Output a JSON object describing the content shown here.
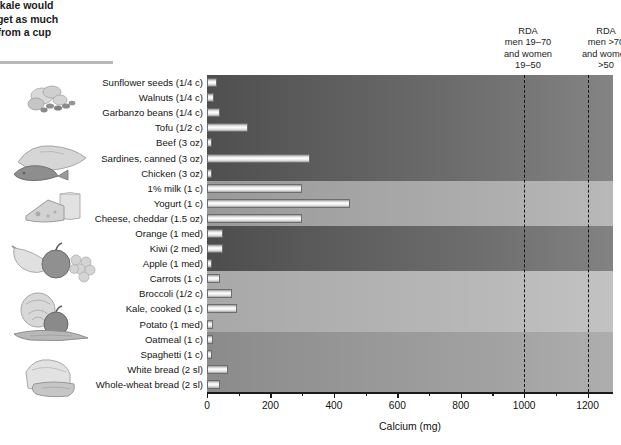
{
  "caption": {
    "lines": [
      "ooked kale would",
      "eat to get as much",
      "ou do from a cup"
    ]
  },
  "rda_labels": [
    {
      "line1": "RDA",
      "line2": "men 19–70",
      "line3": "and women",
      "line4": "19–50",
      "value": 1000
    },
    {
      "line1": "RDA",
      "line2": "men >70",
      "line3": "and women",
      "line4": ">50",
      "value": 1200
    }
  ],
  "axis": {
    "title": "Calcium (mg)",
    "ticks": [
      0,
      200,
      400,
      600,
      800,
      1000,
      1200
    ],
    "min": 0,
    "max": 1280
  },
  "colors": {
    "band_protein": "#4f4f4f",
    "band_dairy": "#9a9a9a",
    "band_fruit": "#4d4d4d",
    "band_vegetable": "#a8a8a8",
    "band_grain": "#8b8b8b",
    "axis": "#1a1a1a",
    "rda_line": "#151515",
    "bar_fill": "#ffffff",
    "bar_stroke": "#6d6d6d"
  },
  "groups": [
    {
      "name": "protein",
      "color": "#4f4f4f",
      "count": 7
    },
    {
      "name": "dairy",
      "color": "#9a9a9a",
      "count": 3
    },
    {
      "name": "fruit",
      "color": "#4d4d4d",
      "count": 3
    },
    {
      "name": "vegetable",
      "color": "#a8a8a8",
      "count": 4
    },
    {
      "name": "grain",
      "color": "#8b8b8b",
      "count": 4
    }
  ],
  "chart_data": {
    "type": "bar",
    "xlabel": "Calcium (mg)",
    "ylabel": "",
    "xlim": [
      0,
      1280
    ],
    "grid": false,
    "orientation": "horizontal",
    "legend": "none",
    "categories": [
      "Sunflower seeds (1/4 c)",
      "Walnuts (1/4 c)",
      "Garbanzo beans (1/4 c)",
      "Tofu (1/2 c)",
      "Beef (3 oz)",
      "Sardines, canned (3 oz)",
      "Chicken (3 oz)",
      "1% milk (1 c)",
      "Yogurt (1 c)",
      "Cheese, cheddar (1.5 oz)",
      "Orange (1 med)",
      "Kiwi (2 med)",
      "Apple (1 med)",
      "Carrots (1 c)",
      "Broccoli (1/2 c)",
      "Kale, cooked (1 c)",
      "Potato (1 med)",
      "Oatmeal (1 c)",
      "Spaghetti (1 c)",
      "White bread (2 sl)",
      "Whole-wheat bread (2 sl)"
    ],
    "values": [
      33,
      22,
      42,
      130,
      11,
      325,
      15,
      300,
      450,
      300,
      52,
      50,
      10,
      42,
      78,
      95,
      20,
      20,
      10,
      65,
      40
    ],
    "annotations": [
      {
        "label": "RDA men 19–70 and women 19–50",
        "x": 1000
      },
      {
        "label": "RDA men >70 and women >50",
        "x": 1200
      }
    ]
  },
  "art": [
    {
      "name": "seeds-nuts-illustration",
      "group": "protein"
    },
    {
      "name": "meat-fish-illustration",
      "group": "protein"
    },
    {
      "name": "cheese-milk-illustration",
      "group": "dairy"
    },
    {
      "name": "fruit-illustration",
      "group": "fruit"
    },
    {
      "name": "vegetables-illustration",
      "group": "vegetable"
    },
    {
      "name": "bread-grains-illustration",
      "group": "grain"
    }
  ]
}
